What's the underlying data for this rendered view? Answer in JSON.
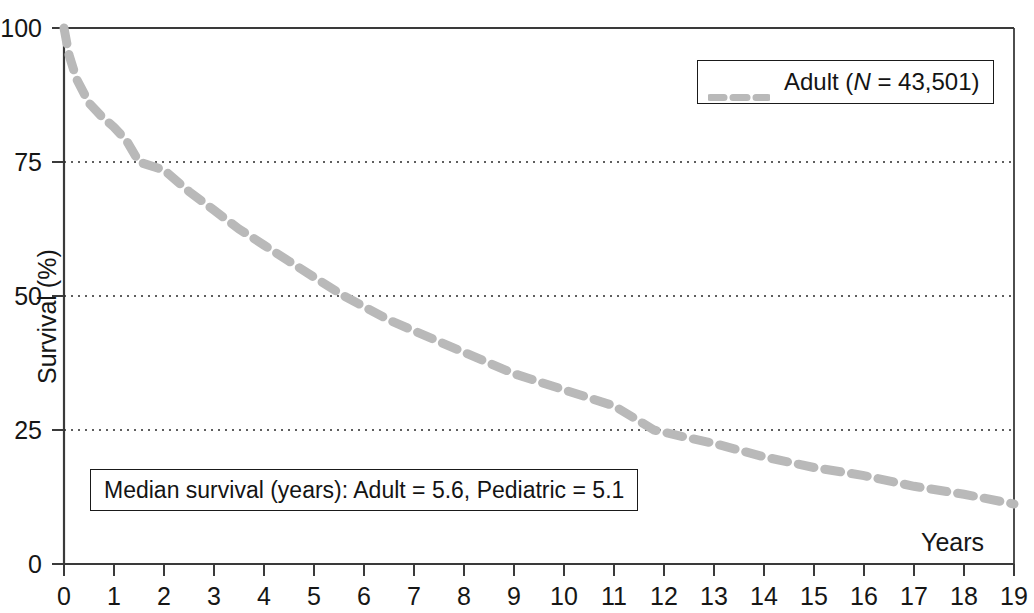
{
  "chart_data": {
    "type": "line",
    "title": "",
    "xlabel": "Years",
    "ylabel": "Survival (%)",
    "xlim": [
      0,
      19
    ],
    "ylim": [
      0,
      100
    ],
    "xticks": [
      "0",
      "1",
      "2",
      "3",
      "4",
      "5",
      "6",
      "7",
      "8",
      "9",
      "10",
      "11",
      "12",
      "13",
      "14",
      "15",
      "16",
      "17",
      "18",
      "19"
    ],
    "yticks": [
      "0",
      "25",
      "50",
      "75",
      "100"
    ],
    "grid": "horizontal dotted gridlines at 25, 50, 75, 100",
    "legend_position": "top-right inside plot",
    "annotations": [
      "Median survival (years): Adult = 5.6, Pediatric = 5.1"
    ],
    "series": [
      {
        "name": "Adult (N = 43,501)",
        "label_plain": "Adult",
        "n_label": "N",
        "n_value": "43,501",
        "color": "#b9b9b9",
        "style": "dashed",
        "x": [
          0,
          0.1,
          0.25,
          0.5,
          0.75,
          1,
          1.25,
          1.5,
          2,
          2.5,
          3,
          3.5,
          4,
          4.5,
          5,
          5.6,
          6,
          6.5,
          7,
          7.5,
          8,
          8.5,
          9,
          9.5,
          10,
          10.5,
          11,
          11.8,
          12.5,
          13,
          14,
          15,
          16,
          17,
          18,
          19
        ],
        "values": [
          100,
          95,
          90.5,
          86,
          83.5,
          81.5,
          79,
          75,
          73.5,
          69.5,
          66,
          62.5,
          59.5,
          56.5,
          53.5,
          50,
          48,
          45.5,
          43.5,
          41.5,
          39.5,
          37.5,
          35.5,
          34,
          32.5,
          31,
          29.5,
          25,
          23.5,
          22.5,
          20,
          18,
          16.5,
          14.5,
          13,
          11.2
        ]
      }
    ]
  },
  "axes": {
    "y_title": "Survival (%)",
    "x_title": "Years",
    "y_tick_labels": [
      "100",
      "75",
      "50",
      "25",
      "0"
    ],
    "x_tick_labels": [
      "0",
      "1",
      "2",
      "3",
      "4",
      "5",
      "6",
      "7",
      "8",
      "9",
      "10",
      "11",
      "12",
      "13",
      "14",
      "15",
      "16",
      "17",
      "18",
      "19"
    ]
  },
  "legend": {
    "entry_prefix": "Adult (",
    "entry_n": "N",
    "entry_suffix": " = 43,501)"
  },
  "annotation": {
    "text": "Median survival (years): Adult = 5.6, Pediatric = 5.1"
  },
  "colors": {
    "curve": "#b9b9b9",
    "axis": "#3a3a3a",
    "grid": "#2b2b2b",
    "text": "#161616",
    "background": "#ffffff"
  }
}
